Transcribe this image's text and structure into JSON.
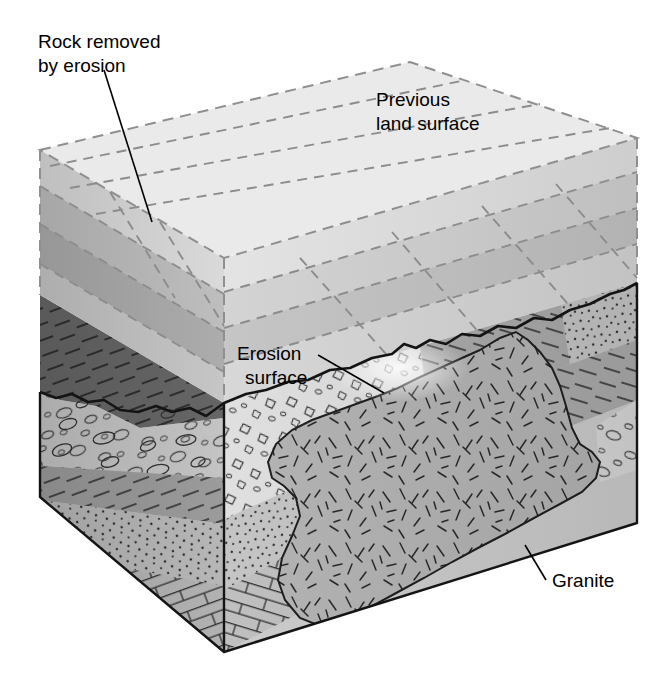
{
  "figure": {
    "background_color": "#ffffff",
    "width": 672,
    "height": 682
  },
  "labels": [
    {
      "id": "rock-removed",
      "line1": "Rock removed",
      "line2": "by erosion",
      "x": 38,
      "y": 48,
      "leader": {
        "x1": 104,
        "y1": 70,
        "x2": 152,
        "y2": 222
      }
    },
    {
      "id": "previous-land-surface",
      "line1": "Previous",
      "line2": "land surface",
      "x": 376,
      "y": 106,
      "leader": null
    },
    {
      "id": "erosion-surface",
      "line1": "Erosion",
      "line2": "surface",
      "x": 237,
      "y": 360,
      "leader": {
        "x1": 318,
        "y1": 355,
        "x2": 384,
        "y2": 393
      }
    },
    {
      "id": "granite",
      "line1": "Granite",
      "line2": "",
      "x": 552,
      "y": 587,
      "leader": {
        "x1": 546,
        "y1": 580,
        "x2": 525,
        "y2": 545
      }
    }
  ],
  "colors": {
    "outline": "#1a1a1a",
    "ghost_dash": "#8c8c8c",
    "label": "#000000",
    "top_surface": "#e8e8e8",
    "ghost_left_light": "#d6d6d6",
    "ghost_left_mid": "#bfbfbf",
    "ghost_left_dark": "#a8a8a8",
    "ghost_right_light": "#e2e2e2",
    "ghost_right_mid": "#d0d0d0",
    "ghost_right_dark": "#bdbdbd",
    "conglomerate": "#c4c4c4",
    "conglomerate_right": "#d4d4d4",
    "shale": "#9a9a9a",
    "shale_right": "#ababab",
    "sandstone": "#b5b5b5",
    "sandstone_right": "#c2c2c2",
    "limestone": "#b0b0b0",
    "limestone_right": "#bcbcbc",
    "granite": "#b2b2b2",
    "dark_shale": "#5f5f5f"
  },
  "geology": {
    "units": [
      {
        "name": "conglomerate",
        "pattern": "ovals-and-pebbles",
        "position": "upper"
      },
      {
        "name": "shale",
        "pattern": "horizontal-dashes",
        "position": "middle"
      },
      {
        "name": "sandstone",
        "pattern": "stipple-dots",
        "position": "lower"
      },
      {
        "name": "limestone",
        "pattern": "brick",
        "position": "basal"
      },
      {
        "name": "granite",
        "pattern": "random-dashes",
        "position": "intrusive-pluton"
      }
    ],
    "features": [
      "erosion surface (unconformity)",
      "ghosted previous land surface shown with dashed lines",
      "tilted sedimentary beds truncated by erosion",
      "granite pluton exposed at erosion surface"
    ]
  }
}
